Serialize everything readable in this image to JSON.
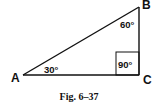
{
  "figure": {
    "caption": "Fig. 6–37",
    "vertices": {
      "A": {
        "label": "A",
        "x": 23,
        "y": 75
      },
      "B": {
        "label": "B",
        "x": 139,
        "y": 7
      },
      "C": {
        "label": "C",
        "x": 139,
        "y": 75
      }
    },
    "angles": {
      "A": "30°",
      "B": "60°",
      "C": "90°"
    },
    "stroke_color": "#111111"
  }
}
